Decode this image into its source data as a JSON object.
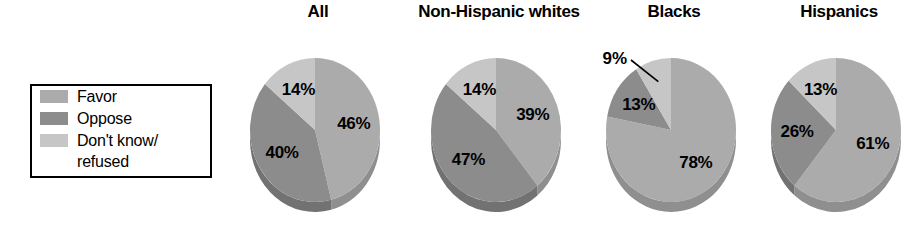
{
  "legend": {
    "name": "chart-legend",
    "items": [
      {
        "label": "Favor",
        "color": "#ababab",
        "key": "favor"
      },
      {
        "label": "Oppose",
        "color": "#8c8c8c",
        "key": "oppose"
      },
      {
        "label": "Don't know/\nrefused",
        "color": "#c6c6c6",
        "key": "dontknow"
      }
    ]
  },
  "colors": {
    "favor": "#ababab",
    "oppose": "#8c8c8c",
    "dontknow": "#c6c6c6",
    "favor_side": "#8f8f8f",
    "oppose_side": "#727272",
    "dontknow_side": "#a9a9a9",
    "background": "#ffffff",
    "text": "#000000"
  },
  "chart_data": {
    "type": "pie",
    "title": "",
    "subtitle": "",
    "xlabel": "",
    "ylabel": "",
    "legend_position": "left",
    "grid": false,
    "value_suffix": "%",
    "categories": [
      "Favor",
      "Oppose",
      "Don't know/refused"
    ],
    "charts": [
      {
        "title": "All",
        "labels": [
          "46%",
          "40%",
          "14%"
        ],
        "values": [
          46,
          40,
          14
        ],
        "callout_index": -1
      },
      {
        "title": "Non-Hispanic whites",
        "labels": [
          "39%",
          "47%",
          "14%"
        ],
        "values": [
          39,
          47,
          14
        ],
        "callout_index": -1
      },
      {
        "title": "Blacks",
        "labels": [
          "78%",
          "13%",
          "9%"
        ],
        "values": [
          78,
          13,
          9
        ],
        "callout_index": 2
      },
      {
        "title": "Hispanics",
        "labels": [
          "61%",
          "26%",
          "13%"
        ],
        "values": [
          61,
          26,
          13
        ],
        "callout_index": -1
      }
    ]
  }
}
